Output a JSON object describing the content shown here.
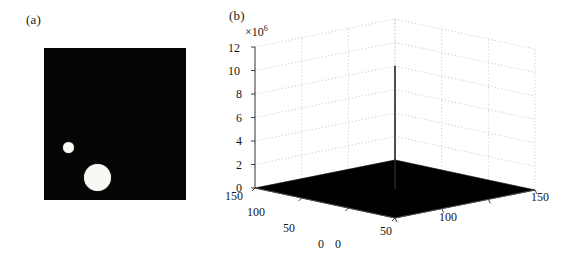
{
  "figure": {
    "background_color": "#ffffff",
    "width": 580,
    "height": 261
  },
  "panel_a": {
    "label": "(a)",
    "name": "binary-image-with-two-disks",
    "background_color": "#050505",
    "blob_color": "#f8f8f4",
    "blobs": [
      {
        "name": "small-disk",
        "cx": 24,
        "cy": 99,
        "r": 5.5
      },
      {
        "name": "large-disk",
        "cx": 53,
        "cy": 129,
        "r": 13.5
      }
    ]
  },
  "panel_b": {
    "label": "(b)",
    "exponent_prefix": "×10",
    "exponent_power": "6",
    "surface_color": "#000000",
    "grid_color": "#b9b9b9",
    "axis_color": "#4a4a4a",
    "spike_color": "#262626"
  },
  "chart_data": {
    "type": "surface",
    "title": "",
    "subtitle": "",
    "xlabel": "",
    "ylabel": "",
    "zlabel": "",
    "z_scale_factor": 1000000,
    "z_scale_label": "×10^6",
    "xlim": [
      0,
      150
    ],
    "ylim": [
      0,
      150
    ],
    "zlim": [
      0,
      12
    ],
    "x_ticks": [
      0,
      50,
      100,
      150
    ],
    "x_tick_labels": [
      "0",
      "50",
      "100",
      "150"
    ],
    "y_ticks": [
      0,
      50,
      100,
      150
    ],
    "y_tick_labels": [
      "0",
      "50",
      "100",
      "150"
    ],
    "z_ticks": [
      0,
      2,
      4,
      6,
      8,
      10,
      12
    ],
    "z_tick_labels": [
      "0",
      "2",
      "4",
      "6",
      "8",
      "10",
      "12"
    ],
    "grid": true,
    "legend": "none",
    "peak": {
      "x": 75,
      "y": 75,
      "z": 10.5
    },
    "baseline": 0.0,
    "series": [
      {
        "name": "surface",
        "samples": [
          {
            "x": 0,
            "y": 0,
            "z": 0.0
          },
          {
            "x": 50,
            "y": 0,
            "z": 0.0
          },
          {
            "x": 100,
            "y": 0,
            "z": 0.0
          },
          {
            "x": 150,
            "y": 0,
            "z": 0.0
          },
          {
            "x": 0,
            "y": 75,
            "z": 0.0
          },
          {
            "x": 75,
            "y": 75,
            "z": 10.5
          },
          {
            "x": 150,
            "y": 75,
            "z": 0.0
          },
          {
            "x": 0,
            "y": 150,
            "z": 0.0
          },
          {
            "x": 75,
            "y": 150,
            "z": 0.0
          },
          {
            "x": 150,
            "y": 150,
            "z": 0.0
          }
        ]
      }
    ]
  },
  "ticks_b": {
    "z": [
      {
        "label": "12",
        "left": 3,
        "top": 41
      },
      {
        "label": "10",
        "left": 3,
        "top": 64
      },
      {
        "label": "8",
        "left": 11,
        "top": 87
      },
      {
        "label": "6",
        "left": 11,
        "top": 111
      },
      {
        "label": "4",
        "left": 11,
        "top": 134
      },
      {
        "label": "2",
        "left": 11,
        "top": 158
      },
      {
        "label": "0",
        "left": 11,
        "top": 181
      }
    ],
    "left_axis": [
      {
        "label": "150",
        "left": 0,
        "top": 189
      },
      {
        "label": "100",
        "left": 22,
        "top": 205
      },
      {
        "label": "50",
        "left": 58,
        "top": 221
      },
      {
        "label": "0",
        "left": 93,
        "top": 237
      }
    ],
    "right_axis": [
      {
        "label": "0",
        "left": 110,
        "top": 237
      },
      {
        "label": "50",
        "left": 155,
        "top": 224
      },
      {
        "label": "100",
        "left": 214,
        "top": 210
      },
      {
        "label": "150",
        "left": 306,
        "top": 190
      }
    ]
  }
}
